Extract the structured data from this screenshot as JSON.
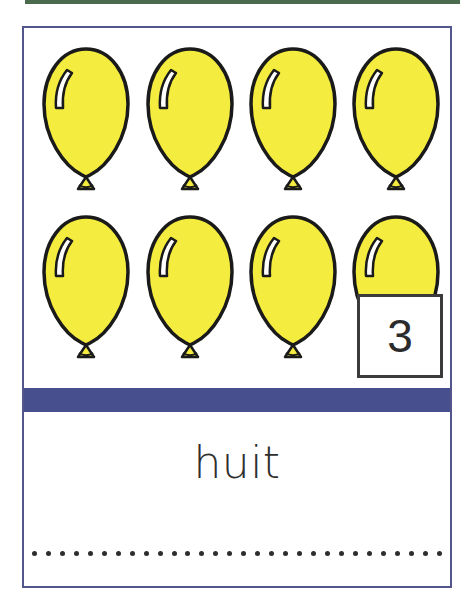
{
  "card": {
    "border_color": "#52568c",
    "background_color": "#ffffff"
  },
  "top_rule": {
    "name": "green-rule",
    "color": "#4a6b4e"
  },
  "divider": {
    "name": "blue-divider",
    "color": "#474f8e"
  },
  "counting": {
    "item_icon": "balloon-icon",
    "item_count": 8,
    "balloon_fill": "#f4ec3e",
    "balloon_outline": "#1a1a1a",
    "balloon_highlight": "#ffffff",
    "balloons": [
      {
        "label": "balloon-1",
        "x": 16,
        "y": 18
      },
      {
        "label": "balloon-2",
        "x": 120,
        "y": 18
      },
      {
        "label": "balloon-3",
        "x": 223,
        "y": 18
      },
      {
        "label": "balloon-4",
        "x": 326,
        "y": 18
      },
      {
        "label": "balloon-5",
        "x": 16,
        "y": 186
      },
      {
        "label": "balloon-6",
        "x": 120,
        "y": 186
      },
      {
        "label": "balloon-7",
        "x": 223,
        "y": 186
      },
      {
        "label": "balloon-8",
        "x": 326,
        "y": 186
      }
    ]
  },
  "number_box": {
    "value": "3",
    "border_color": "#3b3b3b",
    "background_color": "#ffffff"
  },
  "word": {
    "text": "huit",
    "color": "#2e2e2e"
  },
  "writing_line": {
    "dot_count": 30,
    "dot_color": "#2d2d2d"
  }
}
